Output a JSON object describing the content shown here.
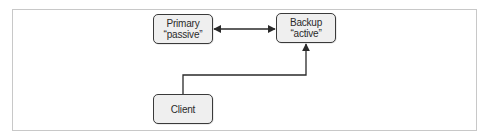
{
  "diagram": {
    "nodes": [
      {
        "id": "primary",
        "label": "Primary",
        "sublabel": "“passive”"
      },
      {
        "id": "backup",
        "label": "Backup",
        "sublabel": "“active”"
      },
      {
        "id": "client",
        "label": "Client",
        "sublabel": ""
      }
    ],
    "edges": [
      {
        "from": "primary",
        "to": "backup",
        "direction": "both"
      },
      {
        "from": "client",
        "to": "backup",
        "direction": "forward"
      }
    ],
    "colors": {
      "node_fill": "#efefef",
      "node_border": "#3a3a3a",
      "edge": "#2a2a2a",
      "frame_border": "#c8c8c8"
    }
  }
}
